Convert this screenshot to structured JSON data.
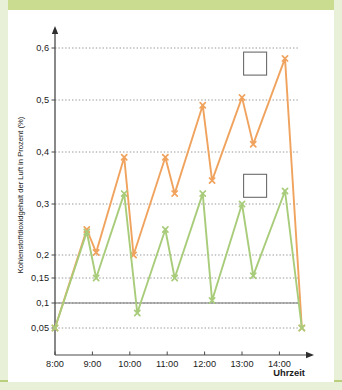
{
  "figure": {
    "background_color": "#ffffff",
    "frame_color": "#c9dc8f"
  },
  "chart_data": {
    "type": "line",
    "title": "",
    "subtitle": "",
    "xlabel": "Uhrzeit",
    "ylabel": "Kohlenstoffdioxidgehalt der Luft in Prozent (%)",
    "x_tick_labels": [
      "8:00",
      "9:00",
      "10:00",
      "11:00",
      "12:00",
      "13:00",
      "14:00"
    ],
    "x_tick_values": [
      8,
      9,
      10,
      11,
      12,
      13,
      14
    ],
    "xlim": [
      7.85,
      15.0
    ],
    "y_tick_labels": [
      "0,05",
      "0,1",
      "0,15",
      "0,2",
      "0,3",
      "0,4",
      "0,5",
      "0,6"
    ],
    "y_tick_values": [
      0.05,
      0.1,
      0.15,
      0.2,
      0.3,
      0.4,
      0.5,
      0.6
    ],
    "y_axis_scale": "nonlinear-piecewise",
    "ylim": [
      0.04,
      0.645
    ],
    "grid": true,
    "grid_style": "dotted",
    "grid_color": "#7d7d7d",
    "baseline_value": 0.1,
    "baseline_color": "#6e6e6e",
    "legend_position": "inside-right",
    "legend_boxes_empty": true,
    "series": [
      {
        "name": "obere Kurve",
        "color": "#f0a35e",
        "marker": "x",
        "x": [
          8.0,
          8.85,
          9.1,
          9.85,
          10.1,
          10.95,
          11.2,
          11.95,
          12.2,
          13.0,
          13.3,
          14.15,
          14.6
        ],
        "values": [
          0.05,
          0.25,
          0.205,
          0.39,
          0.2,
          0.39,
          0.32,
          0.49,
          0.345,
          0.505,
          0.415,
          0.58,
          0.05
        ]
      },
      {
        "name": "untere Kurve",
        "color": "#a8cc7a",
        "marker": "x",
        "x": [
          8.0,
          8.85,
          9.1,
          9.85,
          10.2,
          10.95,
          11.2,
          11.95,
          12.2,
          13.0,
          13.3,
          14.15,
          14.6
        ],
        "values": [
          0.05,
          0.245,
          0.15,
          0.32,
          0.08,
          0.25,
          0.15,
          0.32,
          0.105,
          0.3,
          0.155,
          0.325,
          0.05
        ]
      }
    ],
    "annotations": [
      {
        "name": "legend-box-upper",
        "text": "",
        "x": 13.35,
        "y": 0.57
      },
      {
        "name": "legend-box-lower",
        "text": "",
        "x": 13.35,
        "y": 0.335
      }
    ]
  }
}
